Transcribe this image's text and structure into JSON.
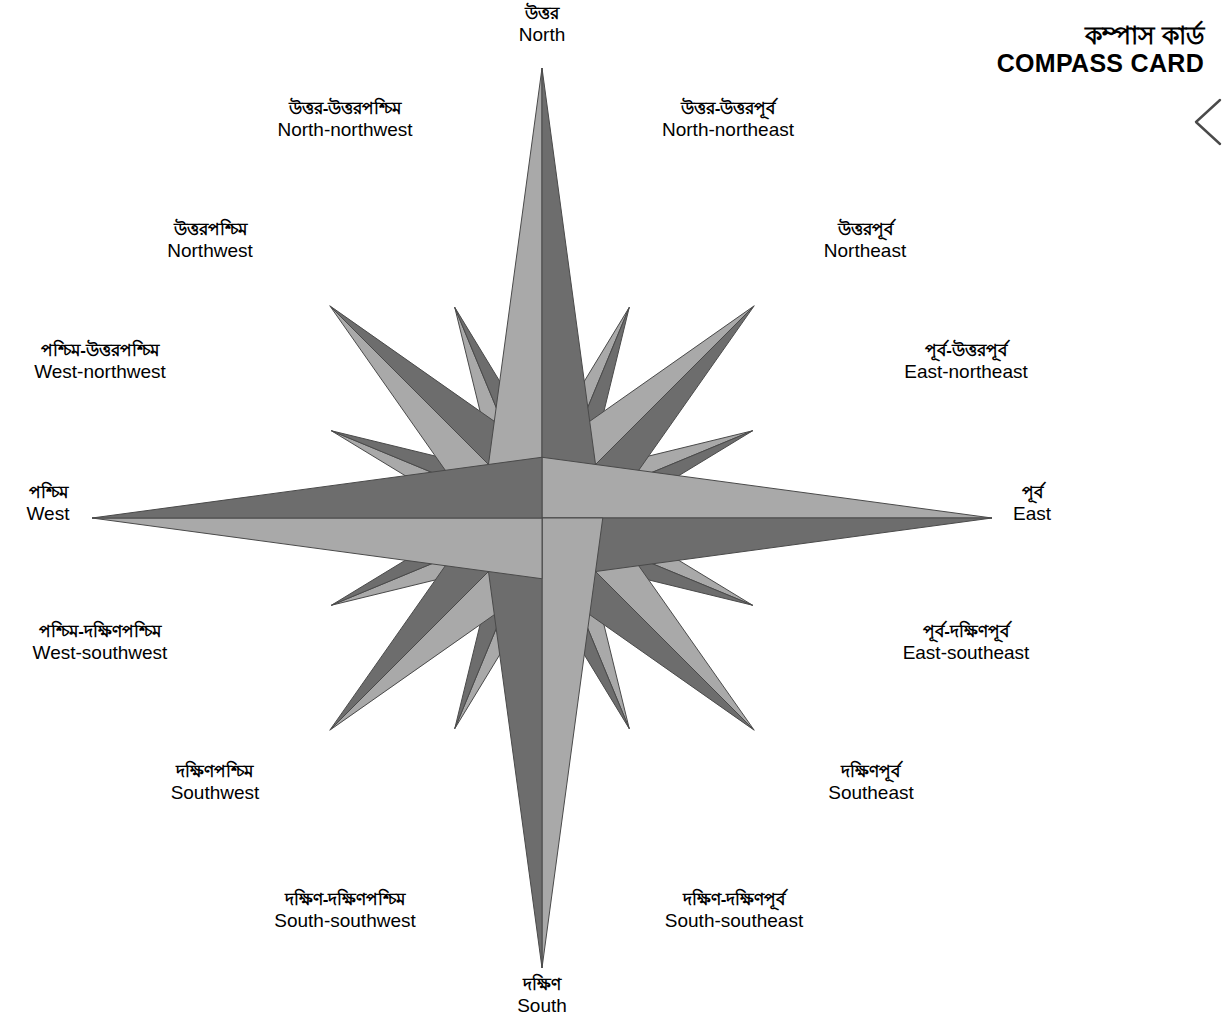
{
  "header": {
    "title_native": "কম্পাস কার্ড",
    "title_latin": "COMPASS CARD",
    "edge_marker_icon": "chevron-left-icon"
  },
  "compass": {
    "colors": {
      "point_light": "#a9a9a9",
      "point_dark": "#6d6d6d",
      "outline": "#4a4a4a",
      "background": "#ffffff"
    },
    "center": {
      "x": 542,
      "y": 518
    },
    "radii": {
      "cardinal": 450,
      "intercardinal": 300,
      "secondary": 228
    },
    "directions": [
      {
        "key": "north",
        "native": "উত্তর",
        "latin": "North",
        "angle_deg": 0,
        "rank": "cardinal",
        "label_x": 542,
        "label_y": 4,
        "label_align": "center"
      },
      {
        "key": "north-northeast",
        "native": "উত্তর-উত্তরপূর্ব",
        "latin": "North-northeast",
        "angle_deg": 22.5,
        "rank": "secondary",
        "label_x": 728,
        "label_y": 99,
        "label_align": "center"
      },
      {
        "key": "northeast",
        "native": "উত্তরপূর্ব",
        "latin": "Northeast",
        "angle_deg": 45,
        "rank": "intercardinal",
        "label_x": 865,
        "label_y": 220,
        "label_align": "center"
      },
      {
        "key": "east-northeast",
        "native": "পূর্ব-উত্তরপূর্ব",
        "latin": "East-northeast",
        "angle_deg": 67.5,
        "rank": "secondary",
        "label_x": 966,
        "label_y": 341,
        "label_align": "center"
      },
      {
        "key": "east",
        "native": "পূর্ব",
        "latin": "East",
        "angle_deg": 90,
        "rank": "cardinal",
        "label_x": 1032,
        "label_y": 483,
        "label_align": "center"
      },
      {
        "key": "east-southeast",
        "native": "পূর্ব-দক্ষিণপূর্ব",
        "latin": "East-southeast",
        "angle_deg": 112.5,
        "rank": "secondary",
        "label_x": 966,
        "label_y": 622,
        "label_align": "center"
      },
      {
        "key": "southeast",
        "native": "দক্ষিণপূর্ব",
        "latin": "Southeast",
        "angle_deg": 135,
        "rank": "intercardinal",
        "label_x": 871,
        "label_y": 762,
        "label_align": "center"
      },
      {
        "key": "south-southeast",
        "native": "দক্ষিণ-দক্ষিণপূর্ব",
        "latin": "South-southeast",
        "angle_deg": 157.5,
        "rank": "secondary",
        "label_x": 734,
        "label_y": 890,
        "label_align": "center"
      },
      {
        "key": "south",
        "native": "দক্ষিণ",
        "latin": "South",
        "angle_deg": 180,
        "rank": "cardinal",
        "label_x": 542,
        "label_y": 975,
        "label_align": "center"
      },
      {
        "key": "south-southwest",
        "native": "দক্ষিণ-দক্ষিণপশ্চিম",
        "latin": "South-southwest",
        "angle_deg": 202.5,
        "rank": "secondary",
        "label_x": 345,
        "label_y": 890,
        "label_align": "center"
      },
      {
        "key": "southwest",
        "native": "দক্ষিণপশ্চিম",
        "latin": "Southwest",
        "angle_deg": 225,
        "rank": "intercardinal",
        "label_x": 215,
        "label_y": 762,
        "label_align": "center"
      },
      {
        "key": "west-southwest",
        "native": "পশ্চিম-দক্ষিণপশ্চিম",
        "latin": "West-southwest",
        "angle_deg": 247.5,
        "rank": "secondary",
        "label_x": 100,
        "label_y": 622,
        "label_align": "center"
      },
      {
        "key": "west",
        "native": "পশ্চিম",
        "latin": "West",
        "angle_deg": 270,
        "rank": "cardinal",
        "label_x": 48,
        "label_y": 483,
        "label_align": "center"
      },
      {
        "key": "west-northwest",
        "native": "পশ্চিম-উত্তরপশ্চিম",
        "latin": "West-northwest",
        "angle_deg": 292.5,
        "rank": "secondary",
        "label_x": 100,
        "label_y": 341,
        "label_align": "center"
      },
      {
        "key": "northwest",
        "native": "উত্তরপশ্চিম",
        "latin": "Northwest",
        "angle_deg": 315,
        "rank": "intercardinal",
        "label_x": 210,
        "label_y": 220,
        "label_align": "center"
      },
      {
        "key": "north-northwest",
        "native": "উত্তর-উত্তরপশ্চিম",
        "latin": "North-northwest",
        "angle_deg": 337.5,
        "rank": "secondary",
        "label_x": 345,
        "label_y": 99,
        "label_align": "center"
      }
    ]
  }
}
